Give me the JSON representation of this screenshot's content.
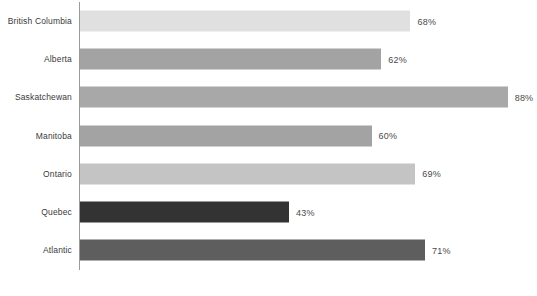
{
  "chart_data": {
    "type": "bar",
    "orientation": "horizontal",
    "title": "",
    "subtitle": "",
    "xlabel": "",
    "ylabel": "",
    "xlim": [
      0,
      100
    ],
    "grid": false,
    "legend": false,
    "value_suffix": "%",
    "categories": [
      "British Columbia",
      "Alberta",
      "Saskatchewan",
      "Manitoba",
      "Ontario",
      "Quebec",
      "Atlantic"
    ],
    "values": [
      68,
      62,
      88,
      60,
      69,
      43,
      71
    ],
    "value_labels": [
      "68%",
      "62%",
      "88%",
      "60%",
      "69%",
      "43%",
      "71%"
    ],
    "bar_colors": [
      "#e0e0e0",
      "#a3a3a3",
      "#a8a8a8",
      "#a3a3a3",
      "#c4c4c4",
      "#333333",
      "#5e5e5e"
    ],
    "axis_color": "#9a9a9a"
  },
  "footnote": {
    "text": ""
  }
}
